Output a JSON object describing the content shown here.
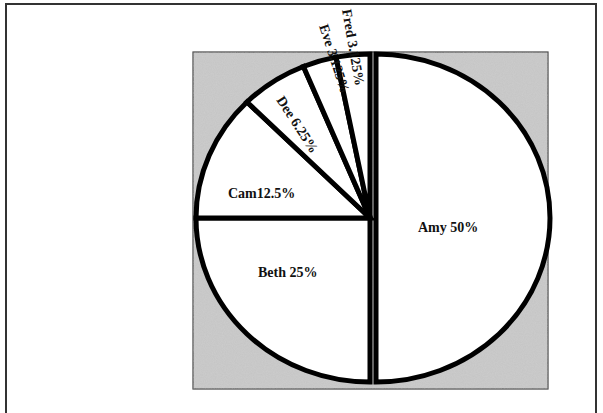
{
  "chart_data": {
    "type": "pie",
    "title": "",
    "categories": [
      "Amy",
      "Beth",
      "Cam",
      "Dee",
      "Eve",
      "Fred"
    ],
    "values": [
      50,
      25,
      12.5,
      6.25,
      3.125,
      3.125
    ],
    "labels": [
      "Amy 50%",
      "Beth 25%",
      "Cam12.5%",
      "Dee 6.25%",
      "Eve 3.125%",
      "Fred 3.125%"
    ],
    "exploded": [
      "Amy"
    ],
    "start_angle": "12 o'clock, counter-clockwise for non-Amy slices",
    "legend": "none",
    "background_color": "#bdbdbd",
    "slice_fill": "#ffffff",
    "slice_stroke": "#000000"
  }
}
